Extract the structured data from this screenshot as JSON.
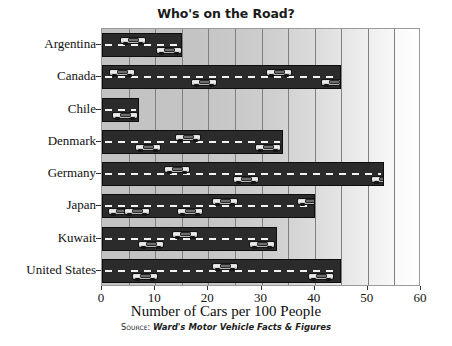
{
  "chart_data": {
    "type": "bar",
    "orientation": "horizontal",
    "title": "Who's on the Road?",
    "xlabel": "Number of Cars per 100 People",
    "ylabel": "",
    "categories": [
      "Argentina",
      "Canada",
      "Chile",
      "Denmark",
      "Germany",
      "Japan",
      "Kuwait",
      "United States"
    ],
    "values": [
      15,
      45,
      7,
      34,
      53,
      40,
      33,
      45
    ],
    "xlim": [
      0,
      60
    ],
    "xticks": [
      0,
      10,
      20,
      30,
      40,
      50,
      60
    ],
    "xtick_labels": [
      "0",
      "10",
      "20",
      "30",
      "40",
      "50",
      "60"
    ],
    "minor_gridlines_every": 5,
    "grid": true,
    "legend": null,
    "bar_style": "road-with-cars",
    "colors": {
      "bar": "#2b2b2b",
      "bar_outline": "#0d0d0d",
      "lane_dash": "#f2f2f2",
      "gridline": "#7f7f7f",
      "plot_background_left": "#c2c2c2",
      "plot_background_right": "#ffffff",
      "text": "#111111"
    }
  },
  "source": {
    "label": "Source:",
    "text": "Ward's Motor Vehicle Facts & Figures"
  },
  "cars": [
    {
      "row": 0,
      "value": 3.2,
      "lane": "top"
    },
    {
      "row": 0,
      "value": 10.0,
      "lane": "bottom"
    },
    {
      "row": 1,
      "value": 1.2,
      "lane": "top"
    },
    {
      "row": 1,
      "value": 30.6,
      "lane": "top"
    },
    {
      "row": 1,
      "value": 16.5,
      "lane": "bottom"
    },
    {
      "row": 1,
      "value": 41.0,
      "lane": "bottom"
    },
    {
      "row": 2,
      "value": 1.6,
      "lane": "bottom"
    },
    {
      "row": 3,
      "value": 6.0,
      "lane": "bottom"
    },
    {
      "row": 3,
      "value": 13.5,
      "lane": "top"
    },
    {
      "row": 3,
      "value": 28.5,
      "lane": "bottom"
    },
    {
      "row": 4,
      "value": 11.5,
      "lane": "top"
    },
    {
      "row": 4,
      "value": 24.5,
      "lane": "bottom"
    },
    {
      "row": 4,
      "value": 50.5,
      "lane": "bottom"
    },
    {
      "row": 5,
      "value": 20.5,
      "lane": "top"
    },
    {
      "row": 5,
      "value": 36.5,
      "lane": "top"
    },
    {
      "row": 5,
      "value": 1.0,
      "lane": "bottom"
    },
    {
      "row": 5,
      "value": 4.0,
      "lane": "bottom"
    },
    {
      "row": 5,
      "value": 14.0,
      "lane": "bottom"
    },
    {
      "row": 6,
      "value": 13.0,
      "lane": "top"
    },
    {
      "row": 6,
      "value": 6.5,
      "lane": "bottom"
    },
    {
      "row": 6,
      "value": 27.5,
      "lane": "bottom"
    },
    {
      "row": 7,
      "value": 20.5,
      "lane": "top"
    },
    {
      "row": 7,
      "value": 5.5,
      "lane": "bottom"
    },
    {
      "row": 7,
      "value": 38.5,
      "lane": "bottom"
    }
  ]
}
